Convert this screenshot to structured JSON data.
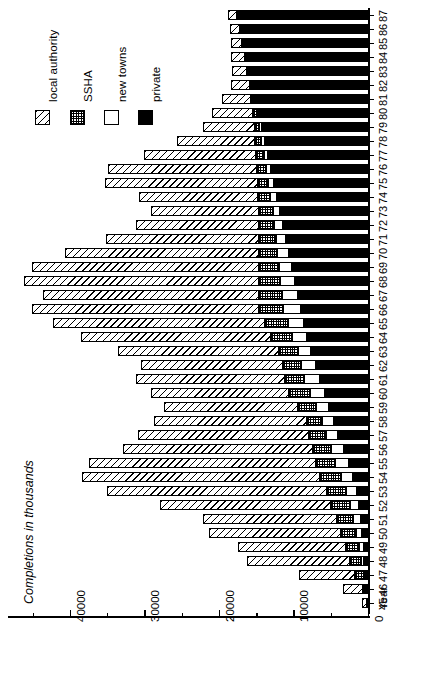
{
  "chart_data": {
    "type": "bar",
    "orientation": "horizontal-rotated",
    "title": "",
    "xlabel": "Year",
    "ylabel": "Completions in thousands",
    "axis_title": "Completions in thousands",
    "year_axis_label": "Year",
    "ylim": [
      0,
      56000
    ],
    "value_ticks": [
      40000,
      30000,
      20000,
      10000,
      0
    ],
    "value_tick_labels": [
      "40000",
      "30000",
      "20000",
      "10000",
      "0"
    ],
    "minor_tick_step": 5000,
    "grid": false,
    "legend_position": "top-left",
    "stacked": true,
    "legend": [
      {
        "label": "local authority",
        "key": "local_authority",
        "pattern": "diagonal-hatch"
      },
      {
        "label": "SSHA",
        "key": "ssha",
        "pattern": "cross-dot"
      },
      {
        "label": "new towns",
        "key": "new_towns",
        "pattern": "white"
      },
      {
        "label": "private",
        "key": "private",
        "pattern": "solid-black"
      }
    ],
    "categories": [
      "45",
      "46",
      "47",
      "48",
      "49",
      "50",
      "51",
      "52",
      "53",
      "54",
      "55",
      "56",
      "57",
      "58",
      "59",
      "60",
      "61",
      "62",
      "63",
      "64",
      "65",
      "66",
      "67",
      "68",
      "69",
      "70",
      "71",
      "72",
      "73",
      "74",
      "75",
      "76",
      "77",
      "78",
      "79",
      "80",
      "81",
      "82",
      "83",
      "84",
      "85",
      "86",
      "87"
    ],
    "series": [
      {
        "name": "local authority",
        "values": [
          600,
          2600,
          7500,
          13800,
          14500,
          17800,
          18000,
          23000,
          29500,
          32000,
          30500,
          25500,
          23000,
          20500,
          18000,
          18500,
          20000,
          19000,
          21500,
          25500,
          28500,
          30500,
          29000,
          31500,
          30500,
          26000,
          20500,
          16500,
          14500,
          16000,
          20500,
          20000,
          15000,
          10500,
          7000,
          5500,
          4000,
          2500,
          2000,
          1800,
          1500,
          1300,
          1200
        ]
      },
      {
        "name": "SSHA",
        "values": [
          0,
          400,
          1200,
          1500,
          1800,
          2000,
          2200,
          2500,
          2600,
          2800,
          2600,
          2400,
          2200,
          2000,
          2400,
          2800,
          2600,
          2400,
          2600,
          2800,
          3000,
          3200,
          3000,
          2800,
          2600,
          2400,
          2200,
          2000,
          1800,
          1600,
          1400,
          1200,
          1000,
          800,
          600,
          500,
          400,
          300,
          250,
          200,
          180,
          160,
          150
        ]
      },
      {
        "name": "new towns",
        "values": [
          0,
          0,
          200,
          400,
          600,
          800,
          1000,
          1200,
          1400,
          1600,
          1800,
          1800,
          1700,
          1600,
          1800,
          2000,
          2200,
          2000,
          1800,
          2000,
          2200,
          2400,
          2200,
          2000,
          1800,
          1600,
          1400,
          1200,
          1000,
          900,
          800,
          700,
          600,
          500,
          400,
          300,
          250,
          200,
          150,
          120,
          100,
          80,
          60
        ]
      },
      {
        "name": "private",
        "values": [
          200,
          300,
          400,
          500,
          600,
          800,
          1000,
          1200,
          1500,
          2000,
          2600,
          3200,
          4000,
          4600,
          5200,
          5800,
          6400,
          7000,
          7600,
          8200,
          8600,
          9000,
          9400,
          9800,
          10200,
          10600,
          11000,
          11400,
          11800,
          12200,
          12600,
          13000,
          13400,
          13800,
          14200,
          14600,
          15000,
          15400,
          15800,
          16200,
          16600,
          17000,
          17400
        ]
      }
    ]
  },
  "layout": {
    "plot_left_px": 368,
    "plot_top_px": 10,
    "bar_pitch_px": 14.0,
    "bar_thick_px": 9.6,
    "units_per_px": 134.2
  }
}
